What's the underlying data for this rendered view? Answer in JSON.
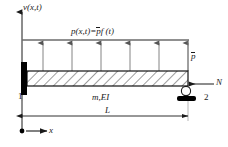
{
  "figure": {
    "type": "structural-beam-diagram"
  },
  "labels": {
    "vertical_axis": "v(x,t)",
    "load_function_prefix": "p(x,t)=",
    "load_function_pbar": "p",
    "load_function_suffix": "f (t)",
    "load_amplitude": "p",
    "axial_force": "N",
    "node_left": "1",
    "node_right": "2",
    "beam_props": "m,EI",
    "span_length": "L",
    "horizontal_axis": "x"
  },
  "geometry": {
    "beam_left_x": 27,
    "beam_right_x": 188,
    "beam_top_y": 71,
    "beam_bottom_y": 86,
    "load_line_y": 40,
    "arrow_count": 6,
    "dimension_line_y": 116,
    "origin_x": 22,
    "origin_y": 131
  },
  "colors": {
    "line": "#1a1a1a",
    "beam_outline": "#111111",
    "hatch": "#4a4a4a",
    "load_line": "#6b6b6b",
    "arrow": "#555555",
    "support_fill": "#000000",
    "background": "#ffffff"
  },
  "supports": {
    "left": "fixed-wall-support",
    "right": "roller-support"
  },
  "arrows": {
    "load_arrow_xs": [
      43,
      72,
      101,
      130,
      159,
      188
    ],
    "direction": "upward"
  }
}
